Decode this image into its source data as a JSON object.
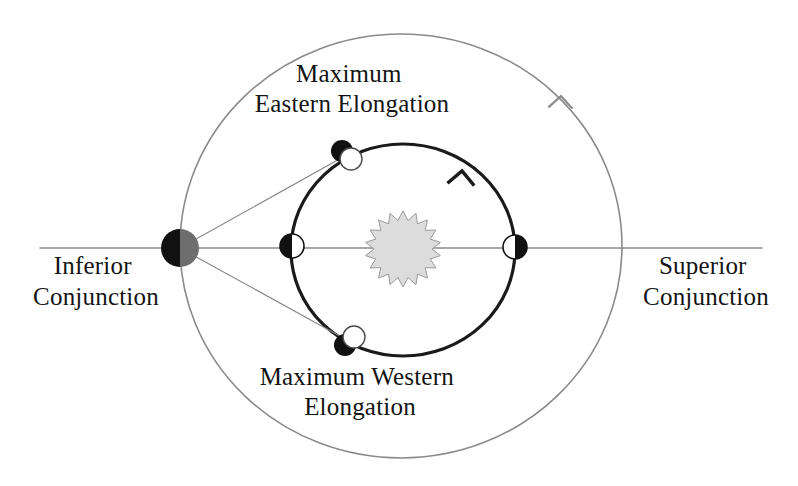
{
  "figure": {
    "background_color": "#ffffff",
    "width": 798,
    "height": 486
  },
  "colors": {
    "outer_orbit_stroke": "#8a8a8a",
    "inner_orbit_stroke": "#1a1a1a",
    "sight_line_stroke": "#8a8a8a",
    "axis_line_stroke": "#8a8a8a",
    "sun_fill": "#dcdcdc",
    "sun_stroke": "#9a9a9a",
    "planet_dark": "#111111",
    "planet_light": "#ffffff",
    "earth_dark": "#111111",
    "earth_gray": "#6e6e6e",
    "text": "#141414"
  },
  "labels": {
    "maximum_eastern_elongation": {
      "line1": "Maximum",
      "line2": "Eastern Elongation",
      "x": 352,
      "y": 82
    },
    "maximum_western_elongation": {
      "line1": "Maximum Western",
      "line2": "Elongation",
      "x": 360,
      "y": 385
    },
    "inferior_conjunction": {
      "line1": "Inferior",
      "line2": "Conjunction",
      "x": 96,
      "y": 274
    },
    "superior_conjunction": {
      "line1": "Superior",
      "line2": "Conjunction",
      "x": 706,
      "y": 274
    }
  },
  "chart_data": {
    "type": "diagram",
    "sun": {
      "name": "Sun",
      "cx": 403,
      "cy": 249,
      "outer_radius": 38,
      "inner_radius": 29,
      "points": 18,
      "fill": "#dcdcdc"
    },
    "outer_orbit": {
      "name": "Earth orbit",
      "cx": 401,
      "cy": 246,
      "rx": 221,
      "ry": 212,
      "stroke": "#8a8a8a",
      "stroke_width": 1.6,
      "direction_arrow": {
        "label": "counter-clockwise",
        "x": 561,
        "y": 96,
        "angle_deg": -42
      }
    },
    "inner_orbit": {
      "name": "Inferior planet orbit",
      "cx": 403,
      "cy": 250,
      "rx": 112,
      "ry": 106,
      "stroke": "#1a1a1a",
      "stroke_width": 3.2,
      "direction_arrow": {
        "label": "counter-clockwise",
        "x": 462,
        "y": 171,
        "angle_deg": -40
      }
    },
    "axis_line": {
      "name": "Earth-Sun line of sight",
      "x1": 40,
      "y1": 248,
      "x2": 762,
      "y2": 248
    },
    "bodies": [
      {
        "id": "earth-inferior-conjunction",
        "label": "Inferior Conjunction",
        "role": "observer",
        "cx": 180,
        "cy": 248,
        "r": 19,
        "phase": "left-dark-right-gray",
        "left_fill": "#111111",
        "right_fill": "#6e6e6e"
      },
      {
        "id": "planet-inferior-conjunction",
        "label": "Inferior Conjunction",
        "role": "planet",
        "cx": 292,
        "cy": 246,
        "r": 12,
        "phase": "new",
        "dark_side": "left",
        "light_side": "right"
      },
      {
        "id": "planet-superior-conjunction",
        "label": "Superior Conjunction",
        "role": "planet",
        "cx": 515,
        "cy": 247,
        "r": 12,
        "phase": "full",
        "dark_side": "right",
        "light_side": "left"
      },
      {
        "id": "planet-maximum-eastern-elongation",
        "label": "Maximum Eastern Elongation",
        "role": "planet",
        "cx": 347,
        "cy": 155,
        "r": 12,
        "phase": "half",
        "dark_offset_x": -5,
        "dark_offset_y": -4,
        "light_offset_x": 4,
        "light_offset_y": 4
      },
      {
        "id": "planet-maximum-western-elongation",
        "label": "Maximum Western Elongation",
        "role": "planet",
        "cx": 350,
        "cy": 341,
        "r": 12,
        "phase": "half",
        "dark_offset_x": -5,
        "dark_offset_y": 4,
        "light_offset_x": 4,
        "light_offset_y": -4
      }
    ],
    "sight_lines": [
      {
        "name": "line-of-sight-eastern-elongation",
        "x1": 180,
        "y1": 248,
        "x2": 352,
        "y2": 152
      },
      {
        "name": "line-of-sight-western-elongation",
        "x1": 180,
        "y1": 248,
        "x2": 356,
        "y2": 345
      }
    ]
  }
}
